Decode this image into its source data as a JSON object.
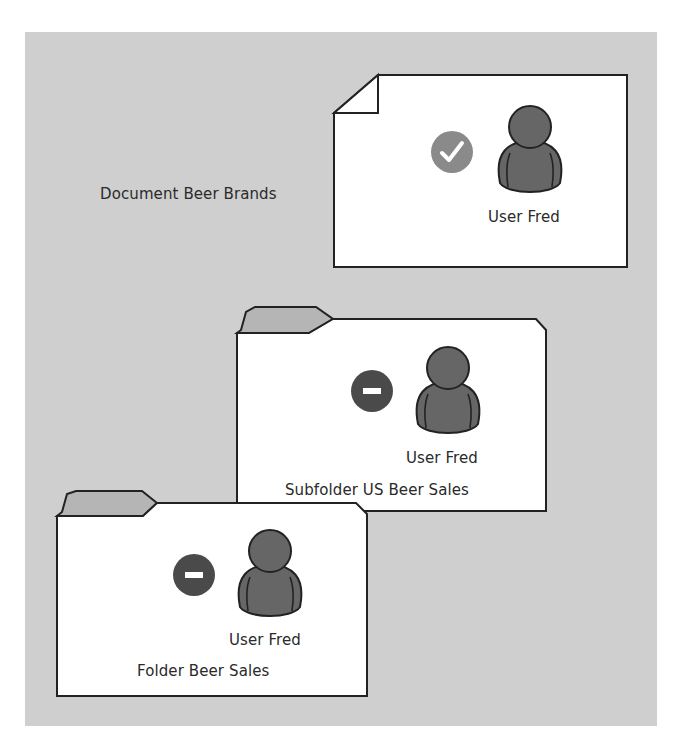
{
  "diagram": {
    "colors": {
      "background_panel": "#cfcfcf",
      "card_fill": "#ffffff",
      "outline": "#222222",
      "tab_fill": "#b5b5b5",
      "user_icon": "#666666",
      "allow_icon": "#8a8a8a",
      "deny_icon": "#4a4a4a"
    },
    "document": {
      "label": "Document Beer Brands",
      "user_label": "User Fred",
      "permission_icon": "check-icon",
      "permission": "allowed"
    },
    "subfolder": {
      "label": "Subfolder US Beer Sales",
      "user_label": "User Fred",
      "permission_icon": "minus-icon",
      "permission": "denied"
    },
    "folder": {
      "label": "Folder Beer Sales",
      "user_label": "User Fred",
      "permission_icon": "minus-icon",
      "permission": "denied"
    }
  }
}
